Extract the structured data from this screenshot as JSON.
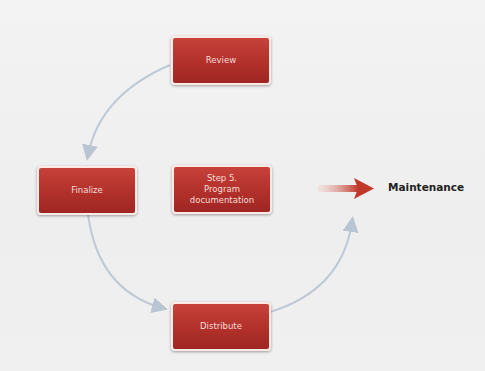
{
  "diagram": {
    "nodes": [
      {
        "id": "review",
        "label": "Review"
      },
      {
        "id": "finalize",
        "label": "Finalize"
      },
      {
        "id": "step5",
        "label": "Step 5.\nProgram documentation",
        "line1": "Step 5.",
        "line2": "Program",
        "line3": "documentation"
      },
      {
        "id": "distribute",
        "label": "Distribute"
      }
    ],
    "output": {
      "label": "Maintenance"
    },
    "edges": [
      {
        "from": "review",
        "to": "finalize"
      },
      {
        "from": "finalize",
        "to": "distribute"
      },
      {
        "from": "distribute",
        "to": "maintenance"
      }
    ],
    "colors": {
      "box": "#b2302b",
      "arrow": "#c0392b",
      "connector": "#b8c4d0"
    }
  }
}
